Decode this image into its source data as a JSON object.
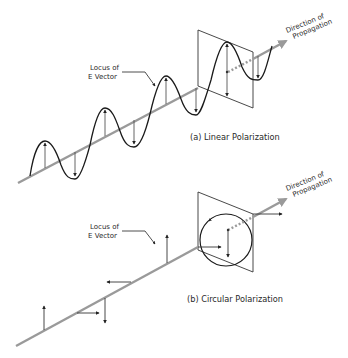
{
  "figure": {
    "panels": [
      {
        "id": "a",
        "caption": "(a) Linear Polarization",
        "locus_label_line1": "Locus of",
        "locus_label_line2": "E Vector",
        "direction_label_line1": "Direction of",
        "direction_label_line2": "Propagation"
      },
      {
        "id": "b",
        "caption": "(b) Circular Polarization",
        "locus_label_line1": "Locus of",
        "locus_label_line2": "E Vector",
        "direction_label_line1": "Direction of",
        "direction_label_line2": "Propagation"
      }
    ],
    "colors": {
      "axis": "#9a9a9a",
      "wave": "#1a1a1a",
      "vector": "#333333",
      "plane": "#333333",
      "background": "#ffffff"
    }
  }
}
